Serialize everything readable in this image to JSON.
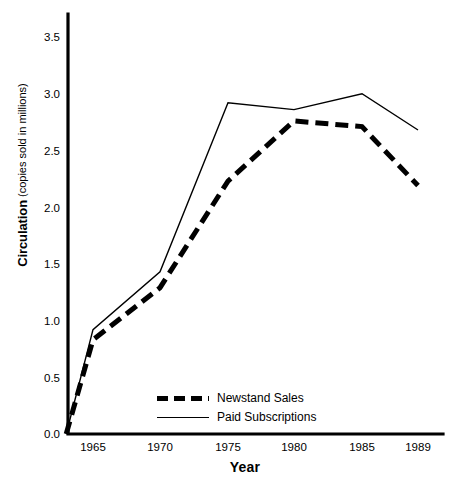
{
  "chart_data": {
    "type": "line",
    "title": "",
    "xlabel": "Year",
    "ylabel": "Circulation",
    "ylabel_sub": "(copies sold in millions)",
    "x": [
      1963,
      1965,
      1970,
      1975,
      1980,
      1985,
      1989
    ],
    "xticks": [
      1965,
      1970,
      1975,
      1980,
      1985,
      1989
    ],
    "xtick_labels": [
      "1965",
      "1970",
      "1975",
      "1980",
      "1985",
      "1989"
    ],
    "yticks": [
      0.0,
      0.5,
      1.0,
      1.5,
      2.0,
      2.5,
      3.0,
      3.5
    ],
    "ytick_labels": [
      "0.0",
      "0.5",
      "1.0",
      "1.5",
      "2.0",
      "2.5",
      "3.0",
      "3.5"
    ],
    "ylim": [
      0.0,
      3.7
    ],
    "xlim": [
      1962.4,
      1990.2
    ],
    "grid": false,
    "legend_position": "lower-center",
    "series": [
      {
        "name": "Newstand Sales",
        "style": "dashed",
        "color": "#000000",
        "line_width": 5,
        "values": [
          0.0,
          0.83,
          1.29,
          2.23,
          2.76,
          2.71,
          2.19
        ]
      },
      {
        "name": "Paid Subscriptions",
        "style": "solid",
        "color": "#000000",
        "line_width": 1.4,
        "values": [
          0.0,
          0.92,
          1.43,
          2.92,
          2.86,
          3.0,
          2.68
        ]
      }
    ]
  },
  "legend": {
    "items": [
      {
        "label": "Newstand Sales"
      },
      {
        "label": "Paid Subscriptions"
      }
    ]
  }
}
